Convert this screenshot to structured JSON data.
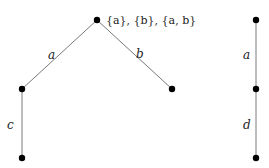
{
  "diagram": {
    "tree1": {
      "root_annotation": "{a}, {b}, {a, b}",
      "edges": [
        {
          "from": "root",
          "to": "left",
          "label": "a"
        },
        {
          "from": "root",
          "to": "right",
          "label": "b"
        },
        {
          "from": "left",
          "to": "left_bottom",
          "label": "c"
        }
      ]
    },
    "tree2": {
      "edges": [
        {
          "from": "top",
          "to": "middle",
          "label": "a"
        },
        {
          "from": "middle",
          "to": "bottom",
          "label": "d"
        }
      ]
    },
    "colors": {
      "edge": "#7a7a7a",
      "node": "#000000",
      "text": "#222222"
    }
  }
}
